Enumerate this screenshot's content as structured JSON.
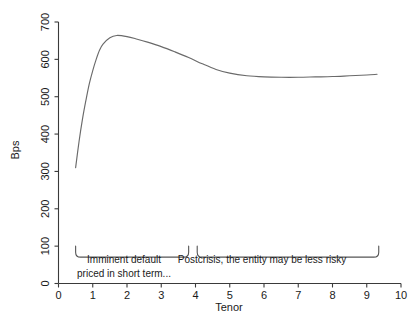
{
  "chart_data": {
    "type": "line",
    "title": "",
    "xlabel": "Tenor",
    "ylabel": "Bps",
    "xlim": [
      0,
      10
    ],
    "ylim": [
      0,
      700
    ],
    "grid": false,
    "legend": "none",
    "x_ticks": [
      "0",
      "1",
      "2",
      "3",
      "4",
      "5",
      "6",
      "7",
      "8",
      "9",
      "10"
    ],
    "y_ticks": [
      "0",
      "100",
      "200",
      "300",
      "400",
      "500",
      "600",
      "700"
    ],
    "series": [
      {
        "name": "CDS spread curve",
        "x": [
          0.5,
          0.6,
          0.7,
          0.8,
          0.9,
          1.0,
          1.1,
          1.2,
          1.3,
          1.5,
          1.7,
          2.0,
          2.3,
          2.6,
          3.0,
          3.4,
          3.8,
          4.2,
          4.6,
          5.0,
          5.5,
          6.0,
          6.5,
          7.0,
          7.5,
          8.0,
          8.5,
          9.0,
          9.3
        ],
        "values": [
          310,
          380,
          440,
          490,
          535,
          570,
          600,
          625,
          641,
          658,
          664,
          661,
          654,
          646,
          634,
          620,
          605,
          588,
          573,
          563,
          556,
          553,
          552,
          552,
          553,
          554,
          556,
          558,
          560
        ]
      }
    ],
    "annotations": [
      {
        "name": "short-term-bracket",
        "text": "Imminent default\npriced in short term...",
        "line1": "Imminent default",
        "line2": "priced in short term...",
        "x_start": 0.5,
        "x_end": 3.8,
        "y_level": 100
      },
      {
        "name": "postcrisis-bracket",
        "text": "Postcrisis, the entity may be less risky",
        "line1": "Postcrisis, the entity may be less risky",
        "line2": "",
        "x_start": 4.05,
        "x_end": 9.35,
        "y_level": 100
      }
    ],
    "colors": {
      "curve": "#6a6a6a",
      "axis": "#3a3a3a",
      "brace": "#555555",
      "text": "#1a1a1a",
      "background": "#ffffff"
    }
  }
}
